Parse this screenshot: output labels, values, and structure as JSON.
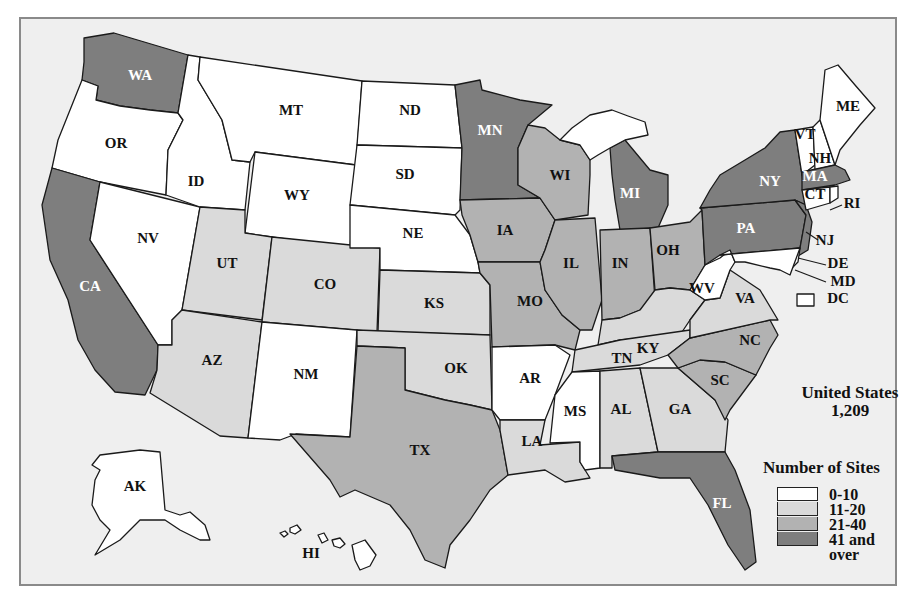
{
  "map": {
    "title_summary": {
      "label": "United States",
      "value": "1,209"
    },
    "background": "#efefef",
    "legend": {
      "title": "Number of Sites",
      "categories": [
        {
          "key": "c1",
          "label": "0-10",
          "color": "#ffffff"
        },
        {
          "key": "c2",
          "label": "11-20",
          "color": "#dadada"
        },
        {
          "key": "c3",
          "label": "21-40",
          "color": "#b2b2b2"
        },
        {
          "key": "c4",
          "label": "41 and over",
          "color": "#7e7e7e"
        }
      ]
    },
    "states": [
      {
        "abbr": "WA",
        "cat": "c4",
        "label_xy": [
          140,
          77
        ],
        "label_color": "#ffffff",
        "points": "84,38 114,33 188,55 178,113 150,110 120,106 96,100 98,86 82,80 84,62"
      },
      {
        "abbr": "OR",
        "cat": "c1",
        "label_xy": [
          116,
          145
        ],
        "label_color": "#111111",
        "points": "82,80 98,86 96,100 120,106 150,110 178,113 183,120 168,150 166,195 100,182 52,168 58,140 70,110"
      },
      {
        "abbr": "CA",
        "cat": "c4",
        "label_xy": [
          90,
          288
        ],
        "label_color": "#ffffff",
        "points": "52,168 100,182 90,240 158,345 157,370 145,395 115,392 95,370 78,340 68,300 50,260 42,205"
      },
      {
        "abbr": "NV",
        "cat": "c1",
        "label_xy": [
          148,
          240
        ],
        "label_color": "#111111",
        "points": "100,182 200,207 182,310 172,320 172,345 158,345 90,240"
      },
      {
        "abbr": "ID",
        "cat": "c1",
        "label_xy": [
          196,
          183
        ],
        "label_color": "#111111",
        "points": "188,55 200,57 198,80 210,100 222,120 232,160 250,162 245,210 200,207 166,195 168,150 183,120 178,113"
      },
      {
        "abbr": "MT",
        "cat": "c1",
        "label_xy": [
          291,
          112
        ],
        "label_color": "#111111",
        "points": "200,57 362,81 356,165 255,152 250,162 232,160 222,120 210,100 198,80"
      },
      {
        "abbr": "WY",
        "cat": "c1",
        "label_xy": [
          297,
          197
        ],
        "label_color": "#111111",
        "points": "255,152 356,165 350,248 245,233"
      },
      {
        "abbr": "UT",
        "cat": "c2",
        "label_xy": [
          227,
          265
        ],
        "label_color": "#111111",
        "points": "200,207 245,210 245,233 272,237 262,320 182,310"
      },
      {
        "abbr": "CO",
        "cat": "c2",
        "label_xy": [
          325,
          286
        ],
        "label_color": "#111111",
        "points": "272,237 380,248 377,332 262,322"
      },
      {
        "abbr": "AZ",
        "cat": "c2",
        "label_xy": [
          212,
          362
        ],
        "label_color": "#111111",
        "points": "182,310 262,322 248,438 220,436 150,393 157,370 158,345 172,345 172,320"
      },
      {
        "abbr": "NM",
        "cat": "c1",
        "label_xy": [
          306,
          376
        ],
        "label_color": "#111111",
        "points": "262,322 357,330 350,437 296,434 280,440 248,438"
      },
      {
        "abbr": "ND",
        "cat": "c1",
        "label_xy": [
          410,
          112
        ],
        "label_color": "#111111",
        "points": "362,81 455,85 462,148 357,145"
      },
      {
        "abbr": "SD",
        "cat": "c1",
        "label_xy": [
          405,
          176
        ],
        "label_color": "#111111",
        "points": "357,145 462,148 460,210 455,215 350,205"
      },
      {
        "abbr": "NE",
        "cat": "c1",
        "label_xy": [
          413,
          235
        ],
        "label_color": "#111111",
        "points": "350,205 455,215 470,235 478,262 480,273 380,270 380,248 350,248"
      },
      {
        "abbr": "KS",
        "cat": "c2",
        "label_xy": [
          434,
          305
        ],
        "label_color": "#111111",
        "points": "380,270 480,273 490,285 490,335 378,332"
      },
      {
        "abbr": "OK",
        "cat": "c2",
        "label_xy": [
          456,
          370
        ],
        "label_color": "#111111",
        "points": "357,330 490,335 492,410 470,405 445,400 405,390 405,348 357,346"
      },
      {
        "abbr": "TX",
        "cat": "c3",
        "label_xy": [
          420,
          452
        ],
        "label_color": "#111111",
        "points": "357,346 405,348 405,390 445,400 470,405 492,410 500,430 508,475 490,490 470,520 450,545 445,568 425,560 410,530 390,505 355,490 340,497 330,480 290,434 350,437"
      },
      {
        "abbr": "MN",
        "cat": "c4",
        "label_xy": [
          490,
          132
        ],
        "label_color": "#ffffff",
        "points": "455,85 480,80 482,90 520,100 552,105 528,125 518,148 518,185 540,198 460,200 462,148"
      },
      {
        "abbr": "IA",
        "cat": "c3",
        "label_xy": [
          505,
          232
        ],
        "label_color": "#111111",
        "points": "460,200 540,198 555,220 545,250 540,262 478,262 470,235 462,215"
      },
      {
        "abbr": "MO",
        "cat": "c3",
        "label_xy": [
          530,
          303
        ],
        "label_color": "#111111",
        "points": "478,262 540,262 545,290 562,315 580,330 575,350 555,345 492,347 490,285 480,273"
      },
      {
        "abbr": "AR",
        "cat": "c1",
        "label_xy": [
          530,
          380
        ],
        "label_color": "#111111",
        "points": "492,347 555,345 570,355 555,395 545,420 500,420 492,410"
      },
      {
        "abbr": "LA",
        "cat": "c2",
        "label_xy": [
          532,
          443
        ],
        "label_color": "#111111",
        "points": "500,420 545,420 540,445 580,442 580,462 590,478 565,482 545,470 508,475 500,430"
      },
      {
        "abbr": "WI",
        "cat": "c3",
        "label_xy": [
          560,
          177
        ],
        "label_color": "#111111",
        "points": "528,125 545,128 560,140 580,145 590,160 590,175 588,215 555,220 540,198 518,185 518,148"
      },
      {
        "abbr": "IL",
        "cat": "c3",
        "label_xy": [
          571,
          265
        ],
        "label_color": "#111111",
        "points": "555,220 595,218 602,300 592,330 580,330 562,315 545,290 540,262 545,250"
      },
      {
        "abbr": "MI",
        "cat": "c4",
        "label_xy": [
          630,
          195
        ],
        "label_color": "#ffffff",
        "points": "610,148 625,140 650,170 668,175 668,205 658,228 620,230 615,200 612,175"
      },
      {
        "abbr": "IN",
        "cat": "c3",
        "label_xy": [
          620,
          265
        ],
        "label_color": "#111111",
        "points": "600,230 650,228 655,300 640,310 620,318 602,320"
      },
      {
        "abbr": "OH",
        "cat": "c3",
        "label_xy": [
          668,
          252
        ],
        "label_color": "#111111",
        "points": "650,228 690,222 702,210 705,265 690,290 670,288 655,290"
      },
      {
        "abbr": "KY",
        "cat": "c2",
        "label_xy": [
          648,
          350
        ],
        "label_color": "#111111",
        "points": "602,320 620,318 640,310 655,290 670,288 690,290 705,300 690,320 680,335 620,340 598,345"
      },
      {
        "abbr": "TN",
        "cat": "c2",
        "label_xy": [
          622,
          360
        ],
        "label_color": "#111111",
        "points": "575,350 598,345 620,340 690,330 690,338 668,355 640,365 572,372"
      },
      {
        "abbr": "MS",
        "cat": "c1",
        "label_xy": [
          575,
          413
        ],
        "label_color": "#111111",
        "points": "572,372 600,371 600,468 585,470 580,462 580,442 550,443 555,395"
      },
      {
        "abbr": "AL",
        "cat": "c2",
        "label_xy": [
          621,
          411
        ],
        "label_color": "#111111",
        "points": "600,371 640,368 658,452 612,456 612,468 600,468"
      },
      {
        "abbr": "GA",
        "cat": "c2",
        "label_xy": [
          680,
          411
        ],
        "label_color": "#111111",
        "points": "640,368 678,368 715,400 728,420 725,452 658,452"
      },
      {
        "abbr": "FL",
        "cat": "c4",
        "label_xy": [
          722,
          505
        ],
        "label_color": "#ffffff",
        "points": "612,456 658,452 725,452 735,470 750,510 756,562 745,570 728,545 708,505 690,478 660,478 632,473 615,470"
      },
      {
        "abbr": "SC",
        "cat": "c3",
        "label_xy": [
          720,
          382
        ],
        "label_color": "#111111",
        "points": "678,368 700,360 725,362 756,375 730,410 725,420 715,400"
      },
      {
        "abbr": "NC",
        "cat": "c3",
        "label_xy": [
          750,
          342
        ],
        "label_color": "#111111",
        "points": "668,355 690,338 770,320 778,335 770,348 756,375 725,362 700,360 678,368"
      },
      {
        "abbr": "VA",
        "cat": "c2",
        "label_xy": [
          745,
          300
        ],
        "label_color": "#111111",
        "points": "690,320 705,300 720,298 730,270 745,280 760,290 778,320 770,320 690,338"
      },
      {
        "abbr": "WV",
        "cat": "c1",
        "label_xy": [
          702,
          290
        ],
        "label_color": "#111111",
        "points": "705,265 720,258 730,250 735,262 730,270 720,298 705,300 690,290"
      },
      {
        "abbr": "PA",
        "cat": "c4",
        "label_xy": [
          746,
          230
        ],
        "label_color": "#ffffff",
        "points": "700,208 795,200 806,215 800,248 720,255 705,265 702,210"
      },
      {
        "abbr": "NY",
        "cat": "c4",
        "label_xy": [
          770,
          183
        ],
        "label_color": "#ffffff",
        "points": "710,190 720,175 745,160 765,148 780,132 795,130 802,175 806,205 795,200 700,208"
      },
      {
        "abbr": "NJ",
        "cat": "c4",
        "label_xy": [
          825,
          242
        ],
        "label_color": "#111111",
        "points": "795,200 806,205 812,222 808,250 798,256 800,248 806,215"
      },
      {
        "abbr": "DE",
        "cat": "c1",
        "label_xy": [
          838,
          265
        ],
        "label_color": "#111111",
        "points": "790,250 800,248 798,262 792,268"
      },
      {
        "abbr": "MD",
        "cat": "c1",
        "label_xy": [
          843,
          283
        ],
        "label_color": "#111111",
        "points": "720,255 800,248 790,275 780,270 770,268 745,262 735,262 730,250"
      },
      {
        "abbr": "VT",
        "cat": "c1",
        "label_xy": [
          805,
          136
        ],
        "label_color": "#111111",
        "points": "795,130 813,127 815,165 802,175"
      },
      {
        "abbr": "NH",
        "cat": "c1",
        "label_xy": [
          820,
          160
        ],
        "label_color": "#111111",
        "points": "813,127 820,120 835,165 815,170"
      },
      {
        "abbr": "ME",
        "cat": "c1",
        "label_xy": [
          848,
          108
        ],
        "label_color": "#111111",
        "points": "820,120 825,70 838,65 855,85 875,108 860,125 840,150 835,165"
      },
      {
        "abbr": "MA",
        "cat": "c4",
        "label_xy": [
          815,
          178
        ],
        "label_color": "#ffffff",
        "points": "802,172 835,165 845,170 850,180 835,185 802,190"
      },
      {
        "abbr": "CT",
        "cat": "c1",
        "label_xy": [
          815,
          196
        ],
        "label_color": "#111111",
        "points": "802,190 830,187 830,203 806,210"
      },
      {
        "abbr": "RI",
        "cat": "c1",
        "label_xy": [
          852,
          205
        ],
        "label_color": "#111111",
        "points": "830,187 838,186 838,198 830,203"
      },
      {
        "abbr": "AK",
        "cat": "c1",
        "label_xy": [
          135,
          488
        ],
        "label_color": "#111111",
        "points": "100,455 140,450 160,452 165,510 180,515 190,512 205,525 210,540 200,540 180,530 165,520 140,520 120,540 95,555 110,530 100,520 92,505 95,480 100,470 92,465"
      },
      {
        "abbr": "HI",
        "cat": "c1",
        "label_xy": [
          311,
          555
        ],
        "label_color": "#111111",
        "points": "352,545 365,540 376,555 370,566 360,570 355,560"
      },
      {
        "abbr": "DC",
        "cat": "c1",
        "label_xy": [
          830,
          300
        ],
        "label_color": "#111111",
        "points": "797,294 814,294 814,306 797,306"
      }
    ],
    "extra_shapes": {
      "upper_peninsula_mi": {
        "cat": "c1",
        "points": "572,128 590,115 612,110 628,116 645,122 648,135 625,140 610,148 598,155 590,160 580,145 560,140"
      },
      "hawaii_islands": [
        {
          "points": "280,533 285,531 288,534 284,537"
        },
        {
          "points": "290,528 297,525 301,530 295,534 290,532"
        },
        {
          "points": "318,535 324,533 328,540 322,543"
        },
        {
          "points": "332,540 340,538 345,544 340,548 334,546"
        }
      ]
    },
    "leader_lines": [
      {
        "from": [
          830,
          210
        ],
        "to": [
          842,
          205
        ],
        "for": "RI"
      },
      {
        "from": [
          806,
          232
        ],
        "to": [
          818,
          240
        ],
        "for": "NJ"
      },
      {
        "from": [
          798,
          258
        ],
        "to": [
          826,
          265
        ],
        "for": "DE"
      },
      {
        "from": [
          795,
          270
        ],
        "to": [
          826,
          282
        ],
        "for": "MD"
      }
    ]
  }
}
